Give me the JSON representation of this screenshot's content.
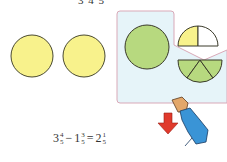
{
  "top_text": "3  4  5",
  "colors": {
    "yellow_circle": "#f8f28c",
    "green_fill": "#b7d97f",
    "panel_bg": "#e6f4f9",
    "panel_border": "#d9a9b8",
    "outline": "#3a3a2a",
    "arrow": "#e03a2c",
    "sleeve": "#3a94d6"
  },
  "figure": {
    "whole_circles": [
      {
        "label": "whole-1",
        "fill": "yellow"
      },
      {
        "label": "whole-2",
        "fill": "yellow"
      },
      {
        "label": "whole-3",
        "fill": "green",
        "in_panel": true
      }
    ],
    "partial_circle": {
      "parts": 5,
      "yellow_parts": 1,
      "white_parts": 1,
      "green_parts_removed": 3
    }
  },
  "formula": {
    "a_whole": "3",
    "a_num": "4",
    "a_den": "5",
    "op": "−",
    "b_whole": "1",
    "b_num": "3",
    "b_den": "5",
    "eq": "=",
    "c_whole": "2",
    "c_num": "1",
    "c_den": "5"
  }
}
